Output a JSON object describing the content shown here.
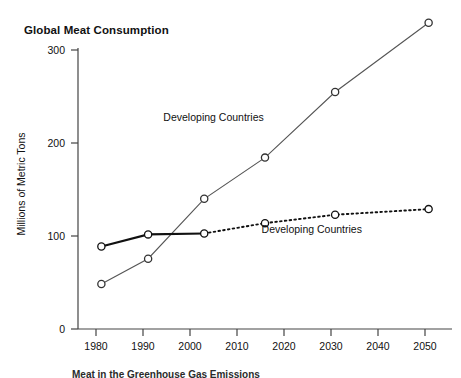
{
  "chart_data": {
    "type": "line",
    "title": "Global Meat Consumption",
    "xlabel": "",
    "ylabel": "Millions of Metric Tons",
    "x": [
      1980,
      1990,
      2002,
      2015,
      2030,
      2050
    ],
    "xlim": [
      1975,
      2055
    ],
    "ylim": [
      0,
      300
    ],
    "xticks": [
      "1980",
      "1990",
      "2000",
      "2010",
      "2020",
      "2030",
      "2040",
      "2050"
    ],
    "xtick_values": [
      1980,
      1990,
      2000,
      2010,
      2020,
      2030,
      2040,
      2050
    ],
    "yticks": [
      "0",
      "100",
      "200",
      "300"
    ],
    "ytick_values": [
      0,
      100,
      200,
      300
    ],
    "grid": false,
    "legend_position": "inline-annotations",
    "series": [
      {
        "name": "Developing Countries",
        "label_text": "Developing Countries",
        "style": "solid-thin",
        "color": "#555555",
        "marker": "open-circle",
        "values": [
          48,
          75,
          139,
          183,
          253,
          327
        ]
      },
      {
        "name": "Developed Countries",
        "label_text": "Developing Countries",
        "style": "solid-thick-then-dotted",
        "color": "#111111",
        "marker": "open-circle",
        "values": [
          88,
          101,
          102,
          113,
          122,
          128
        ]
      }
    ],
    "annotations": [
      {
        "text": "Developing Countries",
        "x": 2004,
        "y": 222
      },
      {
        "text": "Developing Countries",
        "x": 2025,
        "y": 103
      }
    ]
  },
  "caption": {
    "text": "Meat in the Greenhouse Gas Emissions"
  },
  "colors": {
    "axis": "#444444",
    "text": "#111111",
    "developing_line": "#555555",
    "developed_line": "#111111",
    "background": "#ffffff"
  }
}
